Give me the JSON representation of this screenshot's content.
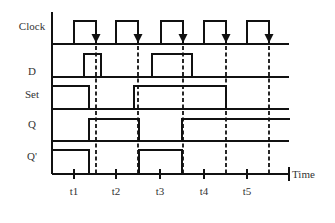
{
  "diagram": {
    "title": "",
    "signals": [
      {
        "name": "Clock",
        "label_y": 30,
        "high_y": 21,
        "low_y": 44,
        "pulses": [
          [
            74,
            96
          ],
          [
            116,
            138
          ],
          [
            161,
            183
          ],
          [
            204,
            226
          ],
          [
            247,
            269
          ]
        ]
      },
      {
        "name": "D",
        "label_y": 75,
        "high_y": 54,
        "low_y": 77,
        "pulses": [
          [
            84,
            101
          ],
          [
            152,
            192
          ]
        ]
      },
      {
        "name": "Set",
        "label_y": 98,
        "high_y": 86,
        "low_y": 109,
        "pulses": [
          [
            52,
            89
          ],
          [
            134,
            226
          ]
        ]
      },
      {
        "name": "Q",
        "label_y": 128,
        "high_y": 119,
        "low_y": 141,
        "pulses": [
          [
            89,
            139
          ],
          [
            182,
            289
          ]
        ]
      },
      {
        "name": "Q'",
        "label_y": 160,
        "high_y": 150,
        "low_y": 174,
        "pulses": [
          [
            52,
            89
          ],
          [
            139,
            182
          ]
        ]
      }
    ],
    "clock_falling_edges_x": [
      96,
      138,
      183,
      226,
      269
    ],
    "axis": {
      "x_start": 52,
      "x_end": 289,
      "y_top": 12,
      "y_time": 174,
      "label": "Time",
      "ticks": [
        {
          "label": "t1",
          "x": 74
        },
        {
          "label": "t2",
          "x": 116
        },
        {
          "label": "t3",
          "x": 160
        },
        {
          "label": "t4",
          "x": 204
        },
        {
          "label": "t5",
          "x": 247
        }
      ]
    },
    "colors": {
      "stroke": "#111111",
      "text": "#333333",
      "background": "#ffffff"
    }
  }
}
